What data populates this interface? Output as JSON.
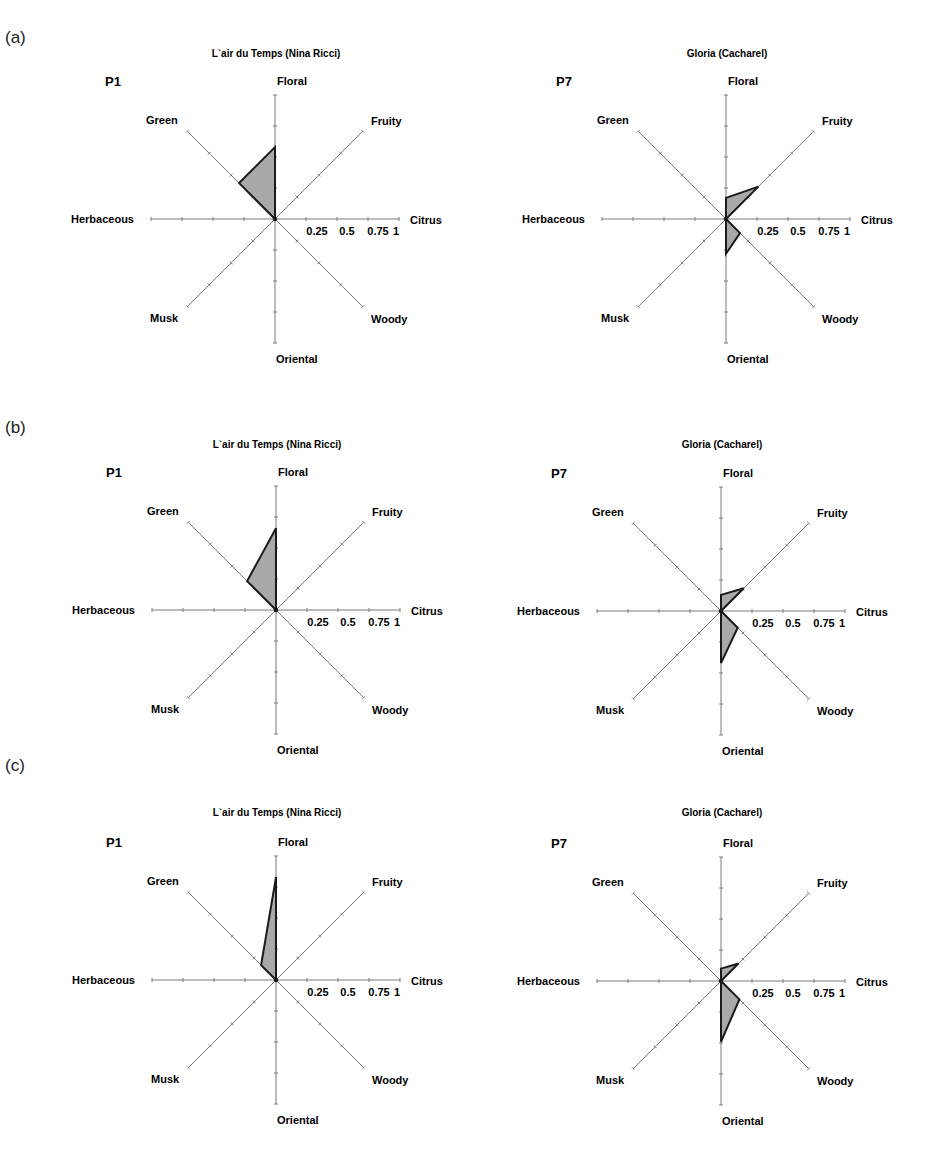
{
  "panels": [
    {
      "label": "(a)"
    },
    {
      "label": "(b)"
    },
    {
      "label": "(c)"
    }
  ],
  "axes": [
    "Floral",
    "Fruity",
    "Citrus",
    "Woody",
    "Oriental",
    "Musk",
    "Herbaceous",
    "Green"
  ],
  "scale_ticks": [
    "0.25",
    "0.5",
    "0.75",
    "1"
  ],
  "colors": {
    "fill": "#a9a9a9",
    "stroke": "#1a1a1a",
    "axis": "#7a7a7a"
  },
  "chart_data": [
    {
      "type": "radar",
      "panel": "(a)",
      "title": "L`air du Temps (Nina Ricci)",
      "participant": "P1",
      "axes": [
        "Floral",
        "Fruity",
        "Citrus",
        "Woody",
        "Oriental",
        "Musk",
        "Herbaceous",
        "Green"
      ],
      "values": [
        0.58,
        0,
        0,
        0,
        0,
        0,
        0,
        0.41
      ],
      "range": [
        0,
        1
      ]
    },
    {
      "type": "radar",
      "panel": "(a)",
      "title": "Gloria (Cacharel)",
      "participant": "P7",
      "axes": [
        "Floral",
        "Fruity",
        "Citrus",
        "Woody",
        "Oriental",
        "Musk",
        "Herbaceous",
        "Green"
      ],
      "values": [
        0.17,
        0.37,
        0,
        0.16,
        0.28,
        0,
        0,
        0
      ],
      "range": [
        0,
        1
      ]
    },
    {
      "type": "radar",
      "panel": "(b)",
      "title": "L`air du Temps (Nina Ricci)",
      "participant": "P1",
      "axes": [
        "Floral",
        "Fruity",
        "Citrus",
        "Woody",
        "Oriental",
        "Musk",
        "Herbaceous",
        "Green"
      ],
      "values": [
        0.66,
        0,
        0,
        0,
        0,
        0,
        0,
        0.33
      ],
      "range": [
        0,
        1
      ]
    },
    {
      "type": "radar",
      "panel": "(b)",
      "title": "Gloria (Cacharel)",
      "participant": "P7",
      "axes": [
        "Floral",
        "Fruity",
        "Citrus",
        "Woody",
        "Oriental",
        "Musk",
        "Herbaceous",
        "Green"
      ],
      "values": [
        0.13,
        0.26,
        0,
        0.19,
        0.42,
        0,
        0,
        0
      ],
      "range": [
        0,
        1
      ]
    },
    {
      "type": "radar",
      "panel": "(c)",
      "title": "L`air du Temps (Nina Ricci)",
      "participant": "P1",
      "axes": [
        "Floral",
        "Fruity",
        "Citrus",
        "Woody",
        "Oriental",
        "Musk",
        "Herbaceous",
        "Green"
      ],
      "values": [
        0.83,
        0,
        0,
        0,
        0,
        0,
        0,
        0.17
      ],
      "range": [
        0,
        1
      ]
    },
    {
      "type": "radar",
      "panel": "(c)",
      "title": "Gloria (Cacharel)",
      "participant": "P7",
      "axes": [
        "Floral",
        "Fruity",
        "Citrus",
        "Woody",
        "Oriental",
        "Musk",
        "Herbaceous",
        "Green"
      ],
      "values": [
        0.1,
        0.2,
        0,
        0.21,
        0.49,
        0,
        0,
        0
      ],
      "range": [
        0,
        1
      ]
    }
  ]
}
